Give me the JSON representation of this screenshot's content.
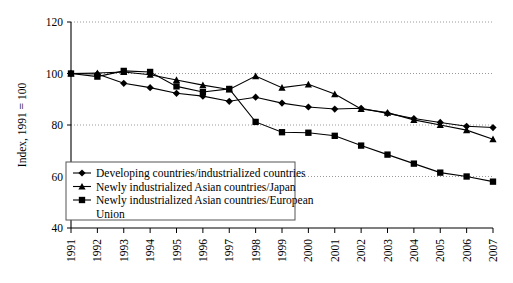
{
  "chart_data": {
    "type": "line",
    "title": "",
    "xlabel": "",
    "ylabel": "Index, 1991 = 100",
    "ylim": [
      40,
      120
    ],
    "yticks": [
      40,
      60,
      80,
      100,
      120
    ],
    "grid": true,
    "grid_style": "dotted-horizontal",
    "legend_position": "inside-bottom-left",
    "x": [
      "1991",
      "1992",
      "1993",
      "1994",
      "1995",
      "1996",
      "1997",
      "1998",
      "1999",
      "2000",
      "2001",
      "2002",
      "2003",
      "2004",
      "2005",
      "2006",
      "2007"
    ],
    "categories": [
      "1991",
      "1992",
      "1993",
      "1994",
      "1995",
      "1996",
      "1997",
      "1998",
      "1999",
      "2000",
      "2001",
      "2002",
      "2003",
      "2004",
      "2005",
      "2006",
      "2007"
    ],
    "series": [
      {
        "name": "Developing countries/industrialized countries",
        "marker": "diamond",
        "values": [
          100,
          99.8,
          96.2,
          94.5,
          92.3,
          91.2,
          89.2,
          90.8,
          88.5,
          87.0,
          86.2,
          86.5,
          84.5,
          82.5,
          81.0,
          79.5,
          79.0
        ]
      },
      {
        "name": "Newly industrialized Asian countries/Japan",
        "marker": "triangle",
        "values": [
          100,
          100.2,
          100.6,
          99.5,
          97.5,
          95.5,
          93.8,
          99.0,
          94.5,
          95.8,
          92.0,
          86.2,
          84.8,
          82.0,
          80.0,
          78.0,
          74.5
        ]
      },
      {
        "name": "Newly industrialized Asian countries/European Union",
        "marker": "square",
        "values": [
          100,
          98.8,
          101.0,
          100.6,
          95.0,
          92.8,
          94.0,
          81.2,
          77.2,
          77.0,
          75.8,
          72.0,
          68.5,
          65.0,
          61.5,
          60.0,
          58.0
        ]
      }
    ]
  },
  "legend": {
    "entries": [
      "Developing countries/industrialized countries",
      "Newly industrialized Asian countries/Japan",
      "Newly industrialized Asian countries/European",
      "Union"
    ]
  }
}
